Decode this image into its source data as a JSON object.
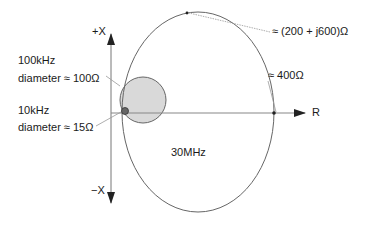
{
  "axes": {
    "x_pos_label": "+X",
    "x_neg_label": "−X",
    "r_label": "R"
  },
  "annotations": {
    "f100k_freq": "100kHz",
    "f100k_diameter": "diameter ≈ 100Ω",
    "f10k_freq": "10kHz",
    "f10k_diameter": "diameter ≈ 15Ω",
    "f30M_label": "30MHz",
    "peak_impedance": "≈ (200 + j600)Ω",
    "real_intercept": "≈ 400Ω"
  },
  "colors": {
    "line": "#555555",
    "circle_fill": "#d9d9d9",
    "dot_fill": "#666666"
  }
}
